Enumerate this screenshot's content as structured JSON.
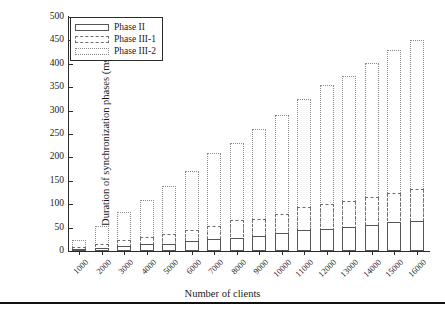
{
  "chart_data": {
    "type": "bar",
    "subtype": "stacked-bar",
    "title": "",
    "xlabel": "Number of clients",
    "ylabel": "Duration of synchronization phases (ms)",
    "categories": [
      "1000",
      "2000",
      "3000",
      "4000",
      "5000",
      "6000",
      "7000",
      "8000",
      "9000",
      "10000",
      "11000",
      "12000",
      "13000",
      "14000",
      "15000",
      "16000"
    ],
    "series": [
      {
        "name": "Phase II",
        "values": [
          4,
          6,
          10,
          14,
          16,
          21,
          26,
          28,
          33,
          39,
          44,
          48,
          52,
          56,
          62,
          65
        ]
      },
      {
        "name": "Phase III-1",
        "values": [
          4,
          10,
          14,
          16,
          20,
          24,
          28,
          38,
          36,
          41,
          51,
          52,
          55,
          59,
          63,
          68
        ]
      },
      {
        "name": "Phase III-2",
        "values": [
          16,
          38,
          59,
          80,
          102,
          127,
          156,
          164,
          191,
          210,
          230,
          255,
          268,
          286,
          305,
          318
        ]
      }
    ],
    "stack_tops": {
      "phase_ii": [
        4,
        6,
        10,
        14,
        16,
        21,
        26,
        28,
        33,
        39,
        44,
        48,
        52,
        56,
        62,
        65
      ],
      "phase_iii_1": [
        8,
        16,
        24,
        30,
        36,
        45,
        54,
        66,
        69,
        80,
        95,
        100,
        107,
        115,
        125,
        133
      ],
      "phase_iii_2": [
        24,
        54,
        83,
        110,
        138,
        172,
        210,
        230,
        260,
        290,
        325,
        355,
        375,
        401,
        430,
        451
      ]
    },
    "ylim": [
      0,
      500
    ],
    "yticks": [
      0,
      50,
      100,
      150,
      200,
      250,
      300,
      350,
      400,
      450,
      500
    ],
    "grid": false,
    "legend_position": "upper left",
    "legend": [
      "Phase II",
      "Phase III-1",
      "Phase III-2"
    ]
  },
  "legend": {
    "items": [
      {
        "label": "Phase II",
        "style": "solid",
        "color": "#555555"
      },
      {
        "label": "Phase III-1",
        "style": "dashed",
        "color": "#6e6e6e"
      },
      {
        "label": "Phase III-2",
        "style": "dotted",
        "color": "#8a8a8a"
      }
    ]
  },
  "axes": {
    "y_title": "Duration of synchronization phases (ms)",
    "x_title": "Number of clients"
  }
}
